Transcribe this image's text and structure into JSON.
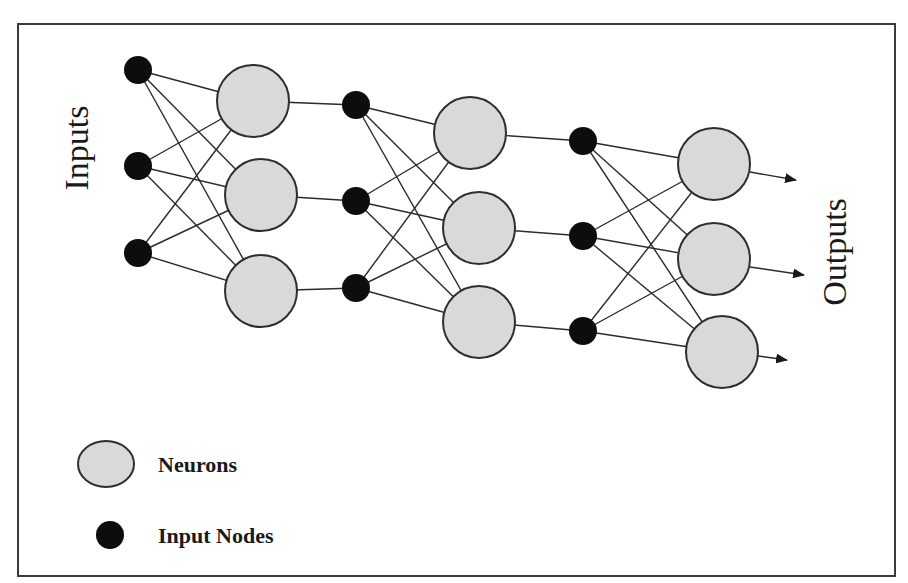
{
  "diagram": {
    "labels": {
      "inputs": "Inputs",
      "outputs": "Outputs"
    },
    "legend": {
      "neurons": "Neurons",
      "input_nodes": "Input Nodes"
    },
    "colors": {
      "neuron_fill": "#d9d9d9",
      "neuron_stroke": "#2e2e2e",
      "input_node_fill": "#0d0d0d",
      "edge": "#2b2b2b",
      "frame": "#3a3a3a"
    },
    "layers": [
      {
        "input_nodes": [
          [
            138,
            70
          ],
          [
            138,
            166
          ],
          [
            138,
            253
          ]
        ],
        "neurons": [
          [
            253,
            101
          ],
          [
            261,
            195
          ],
          [
            261,
            291
          ]
        ]
      },
      {
        "input_nodes": [
          [
            356,
            105
          ],
          [
            356,
            201
          ],
          [
            356,
            288
          ]
        ],
        "neurons": [
          [
            470,
            133
          ],
          [
            479,
            228
          ],
          [
            479,
            322
          ]
        ]
      },
      {
        "input_nodes": [
          [
            583,
            141
          ],
          [
            583,
            236
          ],
          [
            583,
            331
          ]
        ],
        "neurons": [
          [
            714,
            164
          ],
          [
            714,
            259
          ],
          [
            722,
            352
          ]
        ]
      }
    ],
    "output_arrows": [
      {
        "from": [
          750,
          172
        ],
        "to": [
          796,
          180
        ]
      },
      {
        "from": [
          750,
          267
        ],
        "to": [
          804,
          275
        ]
      },
      {
        "from": [
          758,
          356
        ],
        "to": [
          787,
          360
        ]
      }
    ],
    "node_radius": 14,
    "neuron_radius": 36
  }
}
